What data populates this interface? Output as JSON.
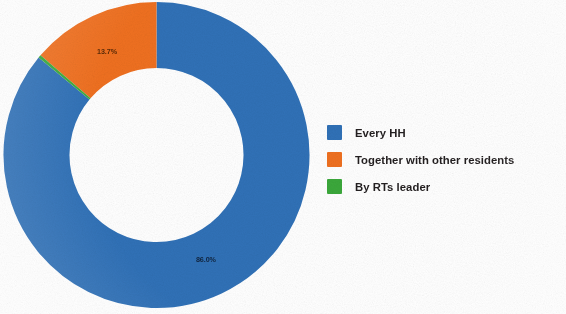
{
  "chart_data": {
    "type": "pie",
    "variant": "donut",
    "title": "",
    "subtitle": "",
    "xlabel": "",
    "ylabel": "",
    "grid": false,
    "legend_position": "right",
    "hole_ratio": 0.57,
    "start_angle_deg": 0,
    "direction": "clockwise",
    "categories": [
      "Every HH",
      "Together with other residents",
      "By RTs leader"
    ],
    "values": [
      86.0,
      13.7,
      0.3
    ],
    "value_unit": "%",
    "colors": [
      "#3071b7",
      "#ef7020",
      "#3ba83b"
    ],
    "slices": [
      {
        "name": "Every HH",
        "value": 86.0,
        "label": "86.0%",
        "color": "#3071b7",
        "label_visible": true,
        "label_color": "#10243e"
      },
      {
        "name": "Together with other residents",
        "value": 13.7,
        "label": "13.7%",
        "color": "#ef7020",
        "label_visible": true,
        "label_color": "#5b2a06"
      },
      {
        "name": "By RTs leader",
        "value": 0.3,
        "label": "0.3%",
        "color": "#3ba83b",
        "label_visible": false,
        "label_color": "#1b3f1b"
      }
    ]
  },
  "legend": {
    "items": [
      {
        "label": "Every HH",
        "color": "#3071b7",
        "swatch_name": "legend-swatch-every-hh"
      },
      {
        "label": "Together with other residents",
        "color": "#ef7020",
        "swatch_name": "legend-swatch-together-with-other-residents"
      },
      {
        "label": "By RTs leader",
        "color": "#3ba83b",
        "swatch_name": "legend-swatch-by-rts-leader"
      }
    ]
  },
  "labels": {
    "blue_slice_value": "86.0%",
    "orange_slice_value": "13.7%"
  },
  "colors": {
    "series_blue": "#3071b7",
    "series_orange": "#ef7020",
    "series_green": "#3ba83b",
    "background": "#ffffff",
    "text": "#231f20"
  }
}
